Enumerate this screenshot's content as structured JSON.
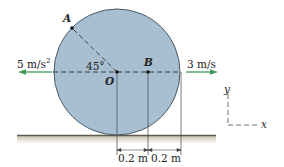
{
  "diagram": {
    "type": "rolling-disk-kinematics",
    "colors": {
      "disk_fill": "#a7bfd1",
      "disk_stroke": "#4a5a66",
      "arrow": "#3f9a5a",
      "ground": "#5e5a4e",
      "ground_shadow": "#cfccb8",
      "line": "#333333"
    },
    "points": {
      "A": "A",
      "O": "O",
      "B": "B"
    },
    "angle_label": "45°",
    "acceleration": {
      "value": "5 m/s",
      "exponent": "2",
      "direction": "left"
    },
    "velocity": {
      "value": "3 m/s",
      "direction": "right"
    },
    "dimensions": [
      "0.2 m",
      "0.2 m"
    ],
    "axes": {
      "x": "x",
      "y": "y"
    }
  }
}
